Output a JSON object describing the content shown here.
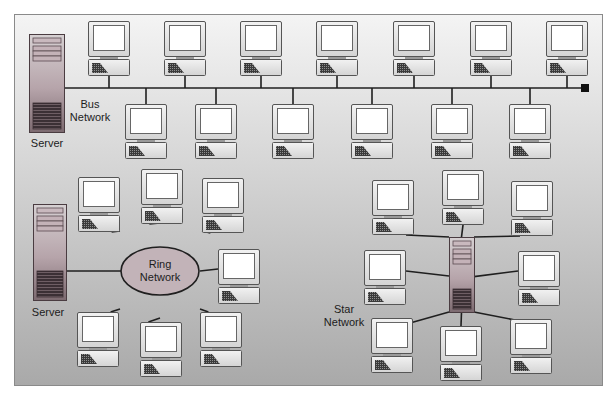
{
  "diagram": {
    "colors": {
      "frame_border": "#8a8a8a",
      "background_top": "#f4f4f4",
      "background_bottom": "#a9a9a9",
      "line": "#1f1f1f",
      "monitor_bezel": "#e6e6e6",
      "screen": "#ffffff",
      "server_body": "#b9a7ad",
      "server_dark": "#3a2e33",
      "ring_fill": "#c2b3b8",
      "terminator": "#111111"
    },
    "bus": {
      "label_line1": "Bus",
      "label_line2": "Network",
      "server_label": "Server",
      "top_row_count": 7,
      "bottom_row_count": 6,
      "has_terminator": true
    },
    "ring": {
      "label_line1": "Ring",
      "label_line2": "Network",
      "server_label": "Server",
      "computer_count": 7
    },
    "star": {
      "label_line1": "Star",
      "label_line2": "Network",
      "hub": "server",
      "computer_count": 8
    }
  }
}
